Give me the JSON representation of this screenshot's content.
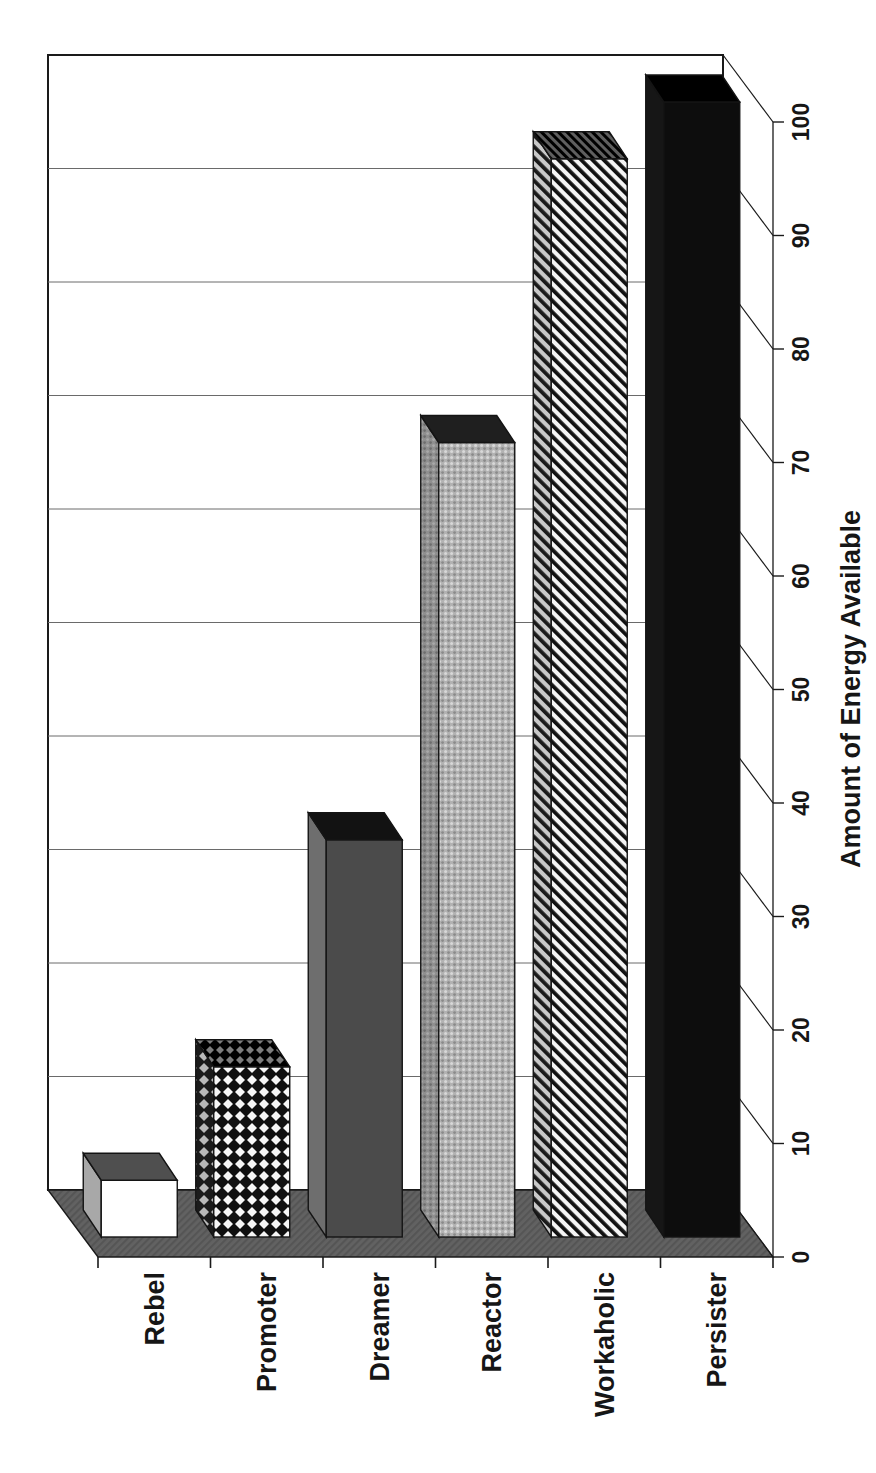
{
  "page": {
    "background": "#ffffff"
  },
  "chart_data": {
    "type": "bar",
    "presentation": "3d-column, page rotated 90deg CCW so bars rise vertically and all text reads bottom-to-top",
    "title": "",
    "categories": [
      "Rebel",
      "Promoter",
      "Dreamer",
      "Reactor",
      "Workaholic",
      "Persister"
    ],
    "values": [
      5,
      15,
      35,
      70,
      95,
      100
    ],
    "bar_patterns": [
      "plain-white",
      "diamond-checker",
      "solid-dark-gray",
      "dotted-light-gray",
      "diagonal-stripes",
      "solid-black"
    ],
    "value_axis": {
      "title": "Amount of Energy Available",
      "min": 0,
      "max": 100,
      "tick_interval": 10,
      "tick_labels": [
        "0",
        "10",
        "20",
        "30",
        "40",
        "50",
        "60",
        "70",
        "80",
        "90",
        "100"
      ]
    },
    "category_axis": {
      "title": ""
    },
    "legend": "none",
    "grid": true,
    "colors": {
      "text": "#161616",
      "axis_line": "#1a1a1a",
      "gridline": "#6a6a6a",
      "wall": "#ffffff",
      "floor": "#5e5e5e",
      "bar_outline": "#141414"
    }
  }
}
